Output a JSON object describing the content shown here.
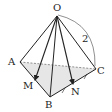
{
  "diagram": {
    "type": "tetrahedron",
    "vertices": {
      "O": "O",
      "A": "A",
      "B": "B",
      "C": "C"
    },
    "points": {
      "M": "M",
      "N": "N"
    },
    "edge_label_OC": "2",
    "colors": {
      "stroke": "#222222",
      "base_fill": "#e6e6e6",
      "dashed": "#666666"
    }
  }
}
